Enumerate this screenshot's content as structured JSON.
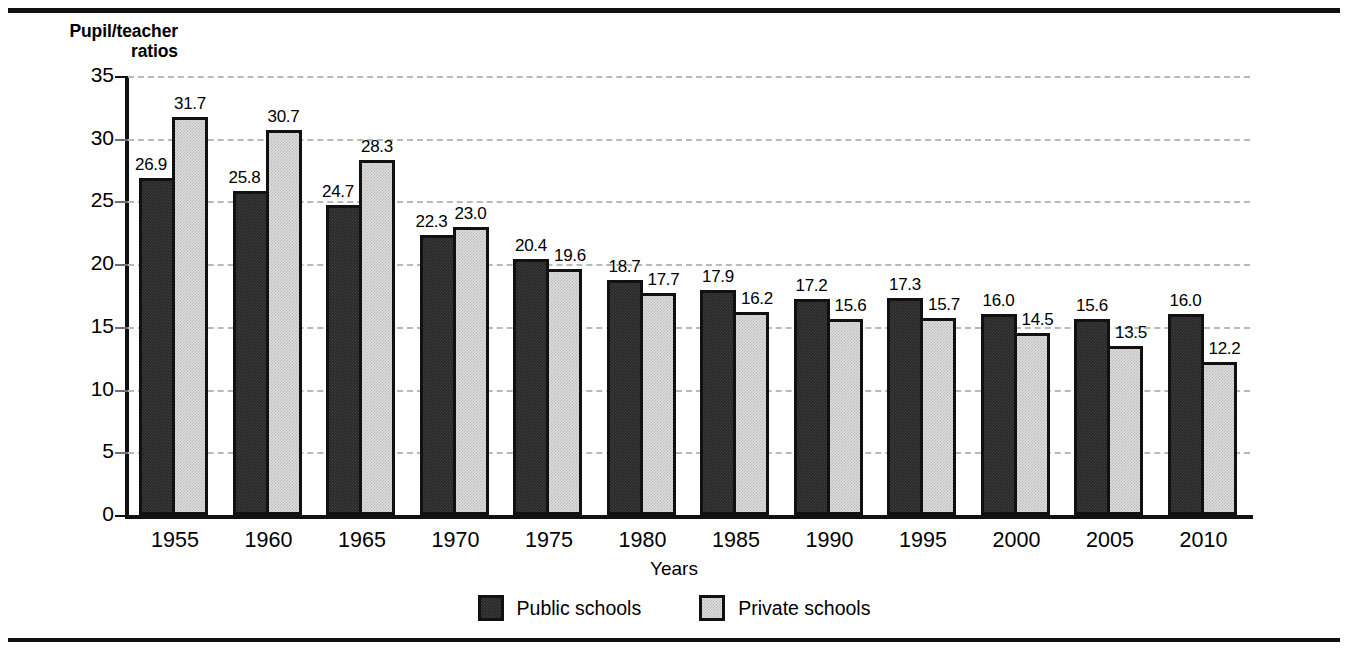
{
  "chart_data": {
    "type": "bar",
    "title": "",
    "subtitle": "",
    "xlabel": "Years",
    "ylabel": "Pupil/teacher\nratios",
    "ylim": [
      0,
      35
    ],
    "ytick_step": 5,
    "yticks": [
      0,
      5,
      10,
      15,
      20,
      25,
      30,
      35
    ],
    "grid": true,
    "grid_style": "dashed-light-gray-horizontal",
    "legend_position": "bottom-center",
    "categories": [
      "1955",
      "1960",
      "1965",
      "1970",
      "1975",
      "1980",
      "1985",
      "1990",
      "1995",
      "2000",
      "2005",
      "2010"
    ],
    "series": [
      {
        "name": "Public schools",
        "color": "#262626",
        "values": [
          26.9,
          25.8,
          24.7,
          22.3,
          20.4,
          18.7,
          17.9,
          17.2,
          17.3,
          16.0,
          15.6,
          16.0
        ],
        "labels": [
          "26.9",
          "25.8",
          "24.7",
          "22.3",
          "20.4",
          "18.7",
          "17.9",
          "17.2",
          "17.3",
          "16.0",
          "15.6",
          "16.0"
        ]
      },
      {
        "name": "Private schools",
        "color": "#dedede",
        "values": [
          31.7,
          30.7,
          28.3,
          23.0,
          19.6,
          17.7,
          16.2,
          15.6,
          15.7,
          14.5,
          13.5,
          12.2
        ],
        "labels": [
          "31.7",
          "30.7",
          "28.3",
          "23.0",
          "19.6",
          "17.7",
          "16.2",
          "15.6",
          "15.7",
          "14.5",
          "13.5",
          "12.2"
        ]
      }
    ]
  },
  "axes": {
    "y_title_line1": "Pupil/teacher",
    "y_title_line2": "ratios",
    "y_title": "Pupil/teacher\nratios",
    "x_title": "Years",
    "ytick_labels": [
      "35",
      "30",
      "25",
      "20",
      "15",
      "10",
      "5",
      "0"
    ],
    "xtick_labels": [
      "1955",
      "1960",
      "1965",
      "1970",
      "1975",
      "1980",
      "1985",
      "1990",
      "1995",
      "2000",
      "2005",
      "2010"
    ]
  },
  "legend": {
    "items": [
      {
        "label": "Public schools",
        "color": "#262626"
      },
      {
        "label": "Private schools",
        "color": "#dedede"
      }
    ]
  },
  "colors": {
    "public": "#262626",
    "private": "#dedede",
    "outline": "#111111",
    "gridline": "#b9b9b9",
    "background": "#ffffff"
  }
}
